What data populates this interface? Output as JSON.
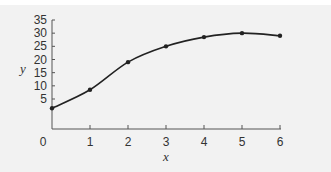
{
  "chart_data": {
    "type": "line",
    "title": "",
    "xlabel": "x",
    "ylabel": "y",
    "x": [
      0,
      1,
      2,
      3,
      4,
      5,
      6
    ],
    "series": [
      {
        "name": "y",
        "values": [
          1.5,
          8.5,
          19,
          25,
          28.5,
          30,
          29
        ],
        "markers": true
      }
    ],
    "x_ticks": [
      "0",
      "1",
      "2",
      "3",
      "4",
      "5",
      "6"
    ],
    "y_ticks": [
      "5",
      "10",
      "15",
      "20",
      "25",
      "30",
      "35"
    ],
    "xlim": [
      0,
      6
    ],
    "ylim": [
      0,
      35
    ],
    "grid": false,
    "legend": "none"
  },
  "colors": {
    "line": "#222222",
    "axis": "#555555",
    "background": "#f2f2f2"
  }
}
